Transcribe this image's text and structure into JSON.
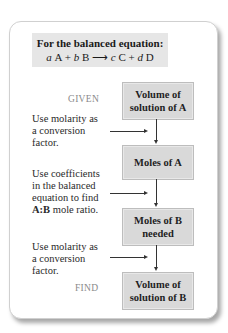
{
  "equation": {
    "title": "For the balanced equation:",
    "parts": {
      "a": "a",
      "A": "A",
      "plus1": "+",
      "b": "b",
      "B": "B",
      "arrow": "⟶",
      "c": "c",
      "C": "C",
      "plus2": "+",
      "d": "d",
      "D": "D"
    }
  },
  "tags": {
    "given": "GIVEN",
    "find": "FIND"
  },
  "boxes": [
    {
      "line1": "Volume of",
      "line2": "solution of A"
    },
    {
      "line1": "Moles of A",
      "line2": ""
    },
    {
      "line1": "Moles of B",
      "line2": "needed"
    },
    {
      "line1": "Volume of",
      "line2": "solution of B"
    }
  ],
  "steps": [
    {
      "lines": [
        "Use molarity as",
        "a conversion",
        "factor."
      ]
    },
    {
      "lines": [
        "Use coefficients",
        "in the balanced",
        "equation to find"
      ],
      "bold": "A:B",
      "tail": " mole ratio."
    },
    {
      "lines": [
        "Use molarity as",
        "a conversion",
        "factor."
      ]
    }
  ],
  "colors": {
    "box_fill": "#d9d9d9",
    "eq_fill": "#e6e6e6",
    "tag_gray": "#8a8a8a"
  }
}
